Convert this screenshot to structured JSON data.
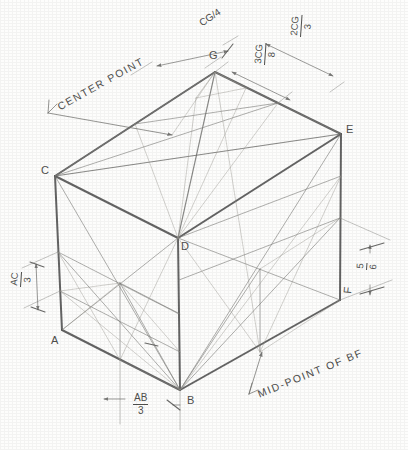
{
  "drawing": {
    "title": "Isometric cube construction layout",
    "subject": "cube",
    "projection": "isometric",
    "background_color": "#fdfdfc",
    "line_color": "#4a4a4a"
  },
  "vertices": [
    {
      "id": "A",
      "label": "A",
      "x": 62,
      "y": 330,
      "label_x": 57,
      "label_y": 336
    },
    {
      "id": "B",
      "label": "B",
      "x": 180,
      "y": 390,
      "label_x": 187,
      "label_y": 395
    },
    {
      "id": "C",
      "label": "C",
      "x": 55,
      "y": 176,
      "label_x": 44,
      "label_y": 167
    },
    {
      "id": "D",
      "label": "D",
      "x": 178,
      "y": 238,
      "label_x": 182,
      "label_y": 243
    },
    {
      "id": "E",
      "label": "E",
      "x": 341,
      "y": 134,
      "label_x": 347,
      "label_y": 126
    },
    {
      "id": "F",
      "label": "F",
      "x": 340,
      "y": 300,
      "label_x": 342,
      "label_y": 296
    },
    {
      "id": "G",
      "label": "G",
      "x": 215,
      "y": 72,
      "label_x": 211,
      "label_y": 52
    }
  ],
  "annotations": [
    {
      "id": "center-point",
      "text": "CENTER POINT",
      "x": 62,
      "y": 97,
      "rotation": -28
    },
    {
      "id": "mid-point-bf",
      "text": "MID-POINT OF BF",
      "x": 262,
      "y": 383,
      "rotation": -22
    }
  ],
  "dimensions": [
    {
      "id": "dim-cg-4",
      "numerator": "CG",
      "denominator": "4",
      "display": "CG/4",
      "style": "slash",
      "x": 214,
      "y": 14,
      "rotation": -32
    },
    {
      "id": "dim-2cg-3",
      "numerator": "2CG",
      "denominator": "3",
      "display": "2CG/3",
      "style": "stacked",
      "x": 307,
      "y": 36,
      "rotation": -88
    },
    {
      "id": "dim-3cg-8",
      "numerator": "3CG",
      "denominator": "8",
      "display": "3CG/8",
      "style": "stacked",
      "x": 271,
      "y": 63,
      "rotation": -88
    },
    {
      "id": "dim-ac-3",
      "numerator": "AC",
      "denominator": "3",
      "display": "AC/3",
      "style": "stacked",
      "x": 26,
      "y": 286,
      "rotation": -88
    },
    {
      "id": "dim-ab-3",
      "numerator": "AB",
      "denominator": "3",
      "display": "AB/3",
      "style": "stacked",
      "x": 140,
      "y": 400,
      "rotation": 0
    },
    {
      "id": "dim-bf-5-6",
      "numerator": "5",
      "denominator": "6",
      "display": "5/6",
      "style": "stacked",
      "x": 371,
      "y": 268,
      "rotation": -88
    }
  ],
  "legend": {
    "note": "Pencil construction drawing of a cube in isometric projection with diagonals, midpoint locators and dimension callouts."
  }
}
